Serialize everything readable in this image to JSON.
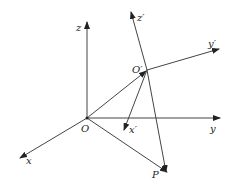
{
  "diagram": {
    "type": "coordinate-frame-transformation",
    "labels": {
      "origin": "O",
      "x": "x",
      "y": "y",
      "z": "z",
      "origin_prime": "O′",
      "x_prime": "x′",
      "y_prime": "y′",
      "z_prime": "z′",
      "point": "P"
    },
    "colors": {
      "line": "#444444",
      "background": "#ffffff"
    }
  }
}
